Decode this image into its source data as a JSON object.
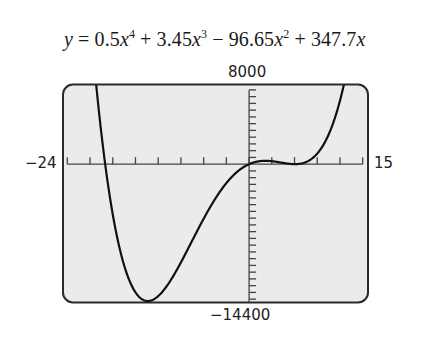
{
  "chart_data": {
    "type": "line",
    "equation": {
      "lhs": "y",
      "terms": [
        {
          "sign": "",
          "coef": "0.5",
          "var": "x",
          "exp": "4"
        },
        {
          "sign": "+",
          "coef": "3.45",
          "var": "x",
          "exp": "3"
        },
        {
          "sign": "−",
          "coef": "96.65",
          "var": "x",
          "exp": "2"
        },
        {
          "sign": "+",
          "coef": "347.7",
          "var": "x",
          "exp": ""
        }
      ]
    },
    "coefficients": [
      0.5,
      3.45,
      -96.65,
      347.7,
      0
    ],
    "window": {
      "xmin": -24,
      "xmax": 15,
      "xscl": 3,
      "ymin": -14400,
      "ymax": 8000,
      "yscl": 700
    },
    "xlim": [
      -24,
      15
    ],
    "ylim": [
      -14400,
      8000
    ],
    "xlabel": "",
    "ylabel": "",
    "grid": false,
    "legend": "none",
    "key_points": [
      {
        "label": "local minimum",
        "x": -13.38,
        "y": -14190
      },
      {
        "label": "local maximum",
        "x": 2.1,
        "y": 350
      },
      {
        "label": "local minimum",
        "x": 6.3,
        "y": -50
      }
    ]
  },
  "labels": {
    "ymax": "8000",
    "ymin": "−14400",
    "xmin": "−24",
    "xmax": "15"
  },
  "colors": {
    "screen_bg": "#ebebeb",
    "frame": "#2a2a2a",
    "curve": "#111111",
    "axis": "#444444"
  }
}
